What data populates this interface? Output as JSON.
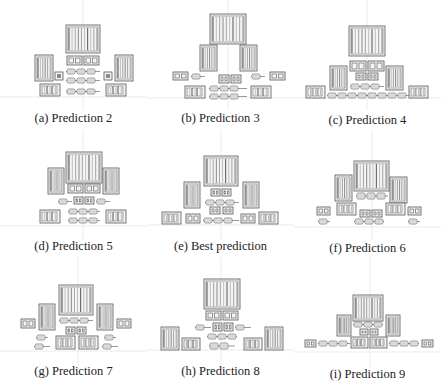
{
  "figure": {
    "panels": [
      {
        "id": "a",
        "caption": "(a) Prediction 2",
        "left": 0,
        "top": 0,
        "caption_top": 111,
        "axes": {
          "vx": 83,
          "hy": 97
        },
        "blocks": [
          {
            "type": "big",
            "x": 66,
            "y": 25,
            "w": 34,
            "h": 28
          },
          {
            "type": "small",
            "x": 67,
            "y": 56,
            "w": 15,
            "h": 9
          },
          {
            "type": "small",
            "x": 84,
            "y": 56,
            "w": 15,
            "h": 9
          },
          {
            "type": "tall",
            "x": 35,
            "y": 55,
            "w": 18,
            "h": 26
          },
          {
            "type": "tall",
            "x": 115,
            "y": 55,
            "w": 18,
            "h": 26
          },
          {
            "type": "chip",
            "x": 55,
            "y": 72,
            "w": 8,
            "h": 8
          },
          {
            "type": "chip",
            "x": 104,
            "y": 72,
            "w": 8,
            "h": 8
          },
          {
            "type": "resistor",
            "x": 66,
            "y": 69,
            "w": 34,
            "h": 5
          },
          {
            "type": "resistor",
            "x": 66,
            "y": 78,
            "w": 34,
            "h": 5
          },
          {
            "type": "resistor",
            "x": 66,
            "y": 89,
            "w": 34,
            "h": 5
          },
          {
            "type": "mod",
            "x": 40,
            "y": 84,
            "w": 20,
            "h": 12
          },
          {
            "type": "mod",
            "x": 106,
            "y": 84,
            "w": 20,
            "h": 12
          }
        ]
      },
      {
        "id": "b",
        "caption": "(b) Prediction 3",
        "left": 147,
        "top": 0,
        "caption_top": 111,
        "axes": {
          "vx": 81,
          "hy": 98
        },
        "blocks": [
          {
            "type": "big",
            "x": 63,
            "y": 14,
            "w": 36,
            "h": 30
          },
          {
            "type": "tall",
            "x": 53,
            "y": 45,
            "w": 17,
            "h": 26
          },
          {
            "type": "tall",
            "x": 93,
            "y": 45,
            "w": 17,
            "h": 26
          },
          {
            "type": "small",
            "x": 26,
            "y": 72,
            "w": 15,
            "h": 8
          },
          {
            "type": "small",
            "x": 72,
            "y": 75,
            "w": 10,
            "h": 8
          },
          {
            "type": "small",
            "x": 84,
            "y": 75,
            "w": 10,
            "h": 8
          },
          {
            "type": "small",
            "x": 123,
            "y": 72,
            "w": 15,
            "h": 8
          },
          {
            "type": "resistor",
            "x": 44,
            "y": 74,
            "w": 14,
            "h": 5
          },
          {
            "type": "resistor",
            "x": 104,
            "y": 74,
            "w": 14,
            "h": 5
          },
          {
            "type": "resistor",
            "x": 62,
            "y": 86,
            "w": 38,
            "h": 5
          },
          {
            "type": "resistor",
            "x": 62,
            "y": 94,
            "w": 38,
            "h": 5
          },
          {
            "type": "mod",
            "x": 38,
            "y": 86,
            "w": 20,
            "h": 12
          },
          {
            "type": "mod",
            "x": 104,
            "y": 86,
            "w": 20,
            "h": 12
          }
        ]
      },
      {
        "id": "c",
        "caption": "(c) Prediction 4",
        "left": 294,
        "top": 0,
        "caption_top": 113,
        "axes": {
          "vx": 73,
          "hy": 98
        },
        "blocks": [
          {
            "type": "big",
            "x": 55,
            "y": 26,
            "w": 36,
            "h": 30
          },
          {
            "type": "small",
            "x": 56,
            "y": 61,
            "w": 16,
            "h": 10
          },
          {
            "type": "small",
            "x": 74,
            "y": 61,
            "w": 16,
            "h": 10
          },
          {
            "type": "small",
            "x": 62,
            "y": 73,
            "w": 10,
            "h": 7
          },
          {
            "type": "small",
            "x": 74,
            "y": 73,
            "w": 10,
            "h": 7
          },
          {
            "type": "tall",
            "x": 36,
            "y": 66,
            "w": 17,
            "h": 24
          },
          {
            "type": "tall",
            "x": 92,
            "y": 66,
            "w": 17,
            "h": 24
          },
          {
            "type": "resistor",
            "x": 56,
            "y": 84,
            "w": 34,
            "h": 5
          },
          {
            "type": "resistor",
            "x": 33,
            "y": 93,
            "w": 82,
            "h": 5
          },
          {
            "type": "mod",
            "x": 12,
            "y": 86,
            "w": 19,
            "h": 12
          },
          {
            "type": "mod",
            "x": 115,
            "y": 86,
            "w": 19,
            "h": 12
          }
        ]
      },
      {
        "id": "d",
        "caption": "(d) Prediction 5",
        "left": 0,
        "top": 130,
        "caption_top": 109,
        "axes": {
          "vx": 83,
          "hy": 96
        },
        "blocks": [
          {
            "type": "big",
            "x": 66,
            "y": 22,
            "w": 36,
            "h": 31
          },
          {
            "type": "tall",
            "x": 48,
            "y": 38,
            "w": 16,
            "h": 26
          },
          {
            "type": "tall",
            "x": 103,
            "y": 38,
            "w": 16,
            "h": 26
          },
          {
            "type": "small",
            "x": 68,
            "y": 54,
            "w": 15,
            "h": 9
          },
          {
            "type": "small",
            "x": 85,
            "y": 54,
            "w": 15,
            "h": 9
          },
          {
            "type": "resistor",
            "x": 58,
            "y": 69,
            "w": 14,
            "h": 5
          },
          {
            "type": "small",
            "x": 74,
            "y": 67,
            "w": 9,
            "h": 7
          },
          {
            "type": "small",
            "x": 85,
            "y": 67,
            "w": 9,
            "h": 7
          },
          {
            "type": "resistor",
            "x": 96,
            "y": 69,
            "w": 14,
            "h": 5
          },
          {
            "type": "resistor",
            "x": 68,
            "y": 79,
            "w": 32,
            "h": 5
          },
          {
            "type": "resistor",
            "x": 68,
            "y": 88,
            "w": 32,
            "h": 5
          },
          {
            "type": "mod",
            "x": 40,
            "y": 80,
            "w": 20,
            "h": 13
          },
          {
            "type": "mod",
            "x": 106,
            "y": 80,
            "w": 20,
            "h": 13
          }
        ]
      },
      {
        "id": "e",
        "caption": "(e) Best prediction",
        "left": 147,
        "top": 130,
        "caption_top": 109,
        "axes": {
          "vx": 74,
          "hy": 95
        },
        "blocks": [
          {
            "type": "big",
            "x": 57,
            "y": 26,
            "w": 34,
            "h": 30
          },
          {
            "type": "tall",
            "x": 37,
            "y": 52,
            "w": 16,
            "h": 26
          },
          {
            "type": "tall",
            "x": 96,
            "y": 52,
            "w": 16,
            "h": 26
          },
          {
            "type": "small",
            "x": 64,
            "y": 59,
            "w": 9,
            "h": 7
          },
          {
            "type": "small",
            "x": 75,
            "y": 59,
            "w": 9,
            "h": 7
          },
          {
            "type": "resistor",
            "x": 58,
            "y": 70,
            "w": 34,
            "h": 5
          },
          {
            "type": "small",
            "x": 63,
            "y": 77,
            "w": 10,
            "h": 7
          },
          {
            "type": "small",
            "x": 76,
            "y": 77,
            "w": 10,
            "h": 7
          },
          {
            "type": "mod",
            "x": 15,
            "y": 82,
            "w": 19,
            "h": 12
          },
          {
            "type": "small",
            "x": 39,
            "y": 84,
            "w": 14,
            "h": 9
          },
          {
            "type": "resistor",
            "x": 56,
            "y": 88,
            "w": 36,
            "h": 5
          },
          {
            "type": "small",
            "x": 94,
            "y": 84,
            "w": 14,
            "h": 9
          },
          {
            "type": "mod",
            "x": 112,
            "y": 82,
            "w": 19,
            "h": 12
          }
        ]
      },
      {
        "id": "f",
        "caption": "(f) Prediction 6",
        "left": 294,
        "top": 130,
        "caption_top": 111,
        "axes": {
          "vx": 78,
          "hy": 97
        },
        "blocks": [
          {
            "type": "big",
            "x": 60,
            "y": 31,
            "w": 35,
            "h": 30
          },
          {
            "type": "tall",
            "x": 41,
            "y": 45,
            "w": 17,
            "h": 26
          },
          {
            "type": "tall",
            "x": 96,
            "y": 47,
            "w": 17,
            "h": 26
          },
          {
            "type": "resistor",
            "x": 62,
            "y": 63,
            "w": 32,
            "h": 6
          },
          {
            "type": "small",
            "x": 23,
            "y": 77,
            "w": 13,
            "h": 8
          },
          {
            "type": "mod",
            "x": 43,
            "y": 73,
            "w": 19,
            "h": 12
          },
          {
            "type": "small",
            "x": 66,
            "y": 80,
            "w": 10,
            "h": 7
          },
          {
            "type": "small",
            "x": 78,
            "y": 80,
            "w": 10,
            "h": 7
          },
          {
            "type": "mod",
            "x": 92,
            "y": 73,
            "w": 19,
            "h": 12
          },
          {
            "type": "small",
            "x": 114,
            "y": 77,
            "w": 13,
            "h": 8
          },
          {
            "type": "resistor",
            "x": 24,
            "y": 89,
            "w": 12,
            "h": 5
          },
          {
            "type": "resistor",
            "x": 60,
            "y": 89,
            "w": 30,
            "h": 5
          },
          {
            "type": "resistor",
            "x": 114,
            "y": 89,
            "w": 12,
            "h": 5
          }
        ]
      },
      {
        "id": "g",
        "caption": "(g) Prediction 7",
        "left": 0,
        "top": 257,
        "caption_top": 107,
        "axes": {
          "vx": 78,
          "hy": 94
        },
        "blocks": [
          {
            "type": "big",
            "x": 59,
            "y": 28,
            "w": 34,
            "h": 30
          },
          {
            "type": "tall",
            "x": 39,
            "y": 47,
            "w": 16,
            "h": 26
          },
          {
            "type": "tall",
            "x": 97,
            "y": 47,
            "w": 16,
            "h": 26
          },
          {
            "type": "small",
            "x": 21,
            "y": 62,
            "w": 14,
            "h": 9
          },
          {
            "type": "small",
            "x": 117,
            "y": 62,
            "w": 14,
            "h": 9
          },
          {
            "type": "resistor",
            "x": 59,
            "y": 61,
            "w": 34,
            "h": 5
          },
          {
            "type": "small",
            "x": 66,
            "y": 70,
            "w": 9,
            "h": 7
          },
          {
            "type": "small",
            "x": 77,
            "y": 70,
            "w": 9,
            "h": 7
          },
          {
            "type": "resistor",
            "x": 36,
            "y": 78,
            "w": 12,
            "h": 5
          },
          {
            "type": "resistor",
            "x": 104,
            "y": 78,
            "w": 12,
            "h": 5
          },
          {
            "type": "mod",
            "x": 56,
            "y": 79,
            "w": 19,
            "h": 13
          },
          {
            "type": "mod",
            "x": 79,
            "y": 79,
            "w": 19,
            "h": 13
          },
          {
            "type": "resistor",
            "x": 34,
            "y": 87,
            "w": 16,
            "h": 5
          },
          {
            "type": "resistor",
            "x": 102,
            "y": 87,
            "w": 16,
            "h": 5
          }
        ]
      },
      {
        "id": "h",
        "caption": "(h) Prediction 8",
        "left": 147,
        "top": 257,
        "caption_top": 107,
        "axes": {
          "vx": 74,
          "hy": 93
        },
        "blocks": [
          {
            "type": "big",
            "x": 57,
            "y": 22,
            "w": 36,
            "h": 30
          },
          {
            "type": "small",
            "x": 59,
            "y": 54,
            "w": 15,
            "h": 9
          },
          {
            "type": "small",
            "x": 76,
            "y": 54,
            "w": 15,
            "h": 9
          },
          {
            "type": "resistor",
            "x": 48,
            "y": 68,
            "w": 16,
            "h": 5
          },
          {
            "type": "small",
            "x": 66,
            "y": 66,
            "w": 9,
            "h": 8
          },
          {
            "type": "small",
            "x": 77,
            "y": 66,
            "w": 9,
            "h": 8
          },
          {
            "type": "resistor",
            "x": 88,
            "y": 68,
            "w": 16,
            "h": 5
          },
          {
            "type": "resistor",
            "x": 60,
            "y": 77,
            "w": 30,
            "h": 5
          },
          {
            "type": "tall",
            "x": 14,
            "y": 70,
            "w": 18,
            "h": 23
          },
          {
            "type": "tall",
            "x": 118,
            "y": 70,
            "w": 18,
            "h": 23
          },
          {
            "type": "mod",
            "x": 35,
            "y": 81,
            "w": 18,
            "h": 12
          },
          {
            "type": "resistor",
            "x": 62,
            "y": 86,
            "w": 26,
            "h": 6
          },
          {
            "type": "mod",
            "x": 97,
            "y": 81,
            "w": 18,
            "h": 12
          }
        ]
      },
      {
        "id": "i",
        "caption": "(i) Prediction 9",
        "left": 294,
        "top": 257,
        "caption_top": 110,
        "axes": {
          "vx": 76,
          "hy": 95
        },
        "blocks": [
          {
            "type": "big",
            "x": 59,
            "y": 38,
            "w": 30,
            "h": 26
          },
          {
            "type": "tall",
            "x": 43,
            "y": 58,
            "w": 14,
            "h": 21
          },
          {
            "type": "tall",
            "x": 92,
            "y": 58,
            "w": 14,
            "h": 21
          },
          {
            "type": "resistor",
            "x": 59,
            "y": 65,
            "w": 30,
            "h": 5
          },
          {
            "type": "small",
            "x": 66,
            "y": 72,
            "w": 8,
            "h": 6
          },
          {
            "type": "small",
            "x": 76,
            "y": 72,
            "w": 8,
            "h": 6
          },
          {
            "type": "small",
            "x": 11,
            "y": 83,
            "w": 11,
            "h": 7
          },
          {
            "type": "resistor",
            "x": 24,
            "y": 84,
            "w": 32,
            "h": 5
          },
          {
            "type": "mod",
            "x": 57,
            "y": 80,
            "w": 17,
            "h": 11
          },
          {
            "type": "mod",
            "x": 76,
            "y": 80,
            "w": 17,
            "h": 11
          },
          {
            "type": "resistor",
            "x": 95,
            "y": 84,
            "w": 30,
            "h": 5
          },
          {
            "type": "small",
            "x": 128,
            "y": 83,
            "w": 11,
            "h": 7
          }
        ]
      }
    ]
  },
  "style": {
    "stroke": "#555555",
    "fill": "#f4f4f4",
    "stripe": "#8a8a8a",
    "axis": "#dddddd"
  }
}
